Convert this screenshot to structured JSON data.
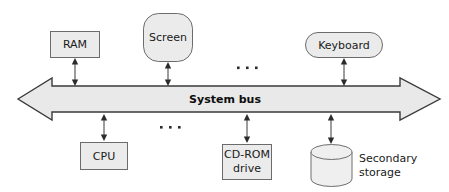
{
  "diagram": {
    "bus": {
      "label": "System bus",
      "direction": "bidirectional"
    },
    "top_nodes": [
      {
        "id": "ram",
        "label": "RAM",
        "shape": "rectangle"
      },
      {
        "id": "screen",
        "label": "Screen",
        "shape": "rounded-rectangle"
      },
      {
        "id": "keyboard",
        "label": "Keyboard",
        "shape": "pill"
      }
    ],
    "bottom_nodes": [
      {
        "id": "cpu",
        "label": "CPU",
        "shape": "rectangle"
      },
      {
        "id": "cdrom",
        "label_line1": "CD-ROM",
        "label_line2": "drive",
        "shape": "rectangle"
      },
      {
        "id": "secondary-storage",
        "label_line1": "Secondary",
        "label_line2": "storage",
        "shape": "cylinder"
      }
    ],
    "ellipses": [
      {
        "id": "ellipsis-top",
        "text": "..."
      },
      {
        "id": "ellipsis-bottom",
        "text": "..."
      }
    ],
    "colors": {
      "shape_fill": "#ebebeb",
      "shape_stroke": "#6b6b6b",
      "bus_fill": "#e9e9e9",
      "bus_stroke": "#3a3a3a",
      "text": "#1a1a1a",
      "background": "#ffffff"
    }
  }
}
